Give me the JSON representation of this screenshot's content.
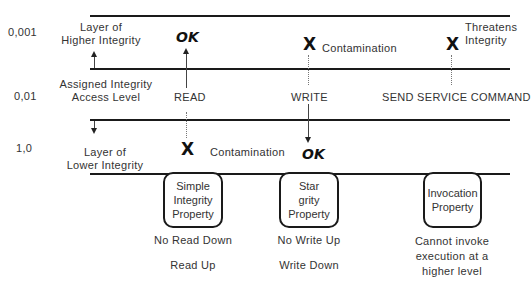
{
  "levels": [
    {
      "value": "0,001"
    },
    {
      "value": "0,01"
    },
    {
      "value": "1,0"
    }
  ],
  "labels": {
    "higher_layer": [
      "Layer of",
      "Higher Integrity"
    ],
    "assigned_level": [
      "Assigned Integrity",
      "Access Level"
    ],
    "lower_layer": [
      "Layer of",
      "Lower Integrity"
    ]
  },
  "operations": [
    {
      "label": "READ"
    },
    {
      "label": "WRITE"
    },
    {
      "label": "SEND SERVICE COMMAND"
    }
  ],
  "outcomes": {
    "read_up": "OK",
    "read_down": "X",
    "read_down_note": "Contamination",
    "write_up": "X",
    "write_up_note": "Contamination",
    "write_down": "OK",
    "invoke_up": "X",
    "invoke_up_note": [
      "Threatens",
      "Integrity"
    ]
  },
  "properties": [
    {
      "box": [
        "Simple",
        "Integrity",
        "Property"
      ],
      "rule1": "No Read Down",
      "rule2": "Read Up"
    },
    {
      "box": [
        "Star",
        "grity",
        "Property"
      ],
      "rule1": "No Write Up",
      "rule2": "Write Down"
    },
    {
      "box": [
        "Invocation",
        "Property"
      ],
      "rule1": [
        "Cannot invoke",
        "execution at a",
        "higher level"
      ]
    }
  ]
}
